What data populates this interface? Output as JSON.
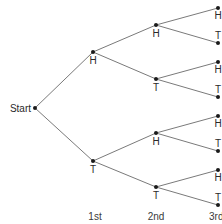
{
  "diagram": {
    "type": "probability-tree",
    "root": {
      "label": "Start",
      "x": 35,
      "y": 108
    },
    "columns": [
      {
        "label": "1st",
        "x": 95
      },
      {
        "label": "2nd",
        "x": 156
      },
      {
        "label": "3rd",
        "x": 218
      }
    ],
    "level1": [
      {
        "label": "H",
        "x": 93,
        "y": 52
      },
      {
        "label": "T",
        "x": 93,
        "y": 161
      }
    ],
    "level2": [
      {
        "label": "H",
        "x": 156,
        "y": 25,
        "parent": 0
      },
      {
        "label": "T",
        "x": 156,
        "y": 79,
        "parent": 0
      },
      {
        "label": "H",
        "x": 156,
        "y": 133,
        "parent": 1
      },
      {
        "label": "T",
        "x": 156,
        "y": 187,
        "parent": 1
      }
    ],
    "level3": [
      {
        "label": "H",
        "x": 218,
        "y": 8,
        "parent": 0
      },
      {
        "label": "T",
        "x": 218,
        "y": 43,
        "parent": 0
      },
      {
        "label": "H",
        "x": 218,
        "y": 62,
        "parent": 1
      },
      {
        "label": "T",
        "x": 218,
        "y": 97,
        "parent": 1
      },
      {
        "label": "H",
        "x": 218,
        "y": 116,
        "parent": 2
      },
      {
        "label": "T",
        "x": 218,
        "y": 151,
        "parent": 2
      },
      {
        "label": "H",
        "x": 218,
        "y": 170,
        "parent": 3
      },
      {
        "label": "T",
        "x": 218,
        "y": 205,
        "parent": 3
      }
    ],
    "colors": {
      "edge": "#7a7a7a",
      "node": "#1a1a1a",
      "text": "#2a2a2a"
    }
  }
}
